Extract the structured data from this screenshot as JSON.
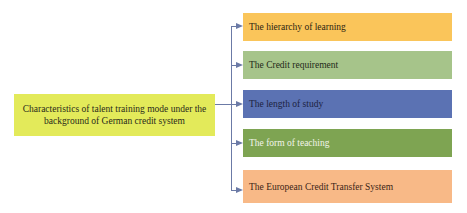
{
  "diagram": {
    "root": {
      "label": "Characteristics of talent training mode under the background of German credit system",
      "color": "#e3ea5a",
      "text_color": "#2a2a1a"
    },
    "branches": [
      {
        "label": "The hierarchy of learning",
        "color": "#fac55a",
        "text_color": "#2a2410"
      },
      {
        "label": "The Credit requirement",
        "color": "#a6c48a",
        "text_color": "#1f2a18"
      },
      {
        "label": "The length of study",
        "color": "#5b72b3",
        "text_color": "#1c2240"
      },
      {
        "label": "The form of teaching",
        "color": "#7ea452",
        "text_color": "#f2f4ea"
      },
      {
        "label": "The European Credit Transfer System",
        "color": "#f8b987",
        "text_color": "#3a2416"
      }
    ],
    "connector_color": "#6b7aa6"
  }
}
